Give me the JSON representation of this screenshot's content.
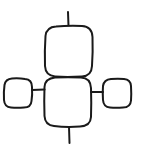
{
  "diagram": {
    "type": "hand-drawn block diagram",
    "stroke_color": "#1a1a1a",
    "background_color": "#ffffff",
    "nodes": [
      {
        "id": "top-box",
        "label": ""
      },
      {
        "id": "center-box",
        "label": ""
      },
      {
        "id": "left-box",
        "label": ""
      },
      {
        "id": "right-box",
        "label": ""
      }
    ],
    "edges": [
      {
        "from": "top-terminal",
        "to": "top-box"
      },
      {
        "from": "left-box",
        "to": "center-box"
      },
      {
        "from": "center-box",
        "to": "right-box"
      },
      {
        "from": "center-box",
        "to": "bottom-terminal"
      }
    ]
  }
}
